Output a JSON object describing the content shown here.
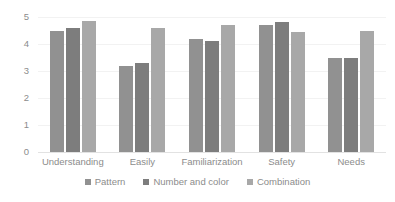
{
  "chart_data": {
    "type": "bar",
    "title": "",
    "subtitle": "",
    "xlabel": "",
    "ylabel": "",
    "ylim": [
      0,
      5
    ],
    "y_ticks": [
      0,
      1,
      2,
      3,
      4,
      5
    ],
    "y_tick_labels": [
      "0",
      "1",
      "2",
      "3",
      "4",
      "5"
    ],
    "grid": true,
    "grid_axis": "y",
    "legend_position": "bottom",
    "categories": [
      "Understanding",
      "Easily",
      "Familiarization",
      "Safety",
      "Needs"
    ],
    "series": [
      {
        "name": "Pattern",
        "color": "#919191",
        "values": [
          4.5,
          3.2,
          4.2,
          4.7,
          3.5
        ]
      },
      {
        "name": "Number and color",
        "color": "#7d7d7d",
        "values": [
          4.6,
          3.3,
          4.1,
          4.8,
          3.5
        ]
      },
      {
        "name": "Combination",
        "color": "#a8a8a8",
        "values": [
          4.85,
          4.6,
          4.7,
          4.45,
          4.5
        ]
      }
    ]
  },
  "colors": {
    "background": "#ffffff",
    "text": "#8c8c8c",
    "gridline": "#f2f2f2",
    "baseline": "#e2e2e2",
    "series_1": "#919191",
    "series_2": "#7d7d7d",
    "series_3": "#a8a8a8"
  }
}
